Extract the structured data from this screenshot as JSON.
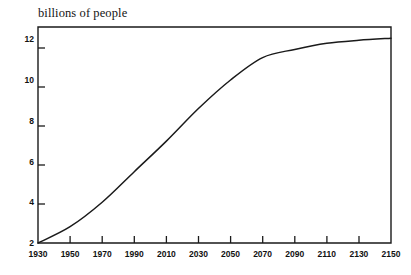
{
  "chart_data": {
    "type": "line",
    "title": "billions of people",
    "subtitle": "",
    "xlabel": "",
    "ylabel": "billions of people",
    "x": [
      1930,
      1950,
      1970,
      1990,
      2010,
      2030,
      2050,
      2070,
      2090,
      2110,
      2130,
      2150
    ],
    "values": [
      2.0,
      2.8,
      4.0,
      5.5,
      7.0,
      8.6,
      10.0,
      11.1,
      11.5,
      11.8,
      11.95,
      12.05
    ],
    "series": [
      {
        "name": "world population",
        "values": [
          2.0,
          2.8,
          4.0,
          5.5,
          7.0,
          8.6,
          10.0,
          11.1,
          11.5,
          11.8,
          11.95,
          12.05
        ]
      }
    ],
    "xlim": [
      1930,
      2150
    ],
    "ylim": [
      2,
      12.6
    ],
    "xticks": [
      1930,
      1950,
      1970,
      1990,
      2010,
      2030,
      2050,
      2070,
      2090,
      2110,
      2130,
      2150
    ],
    "yticks": [
      2,
      4,
      6,
      8,
      10,
      12
    ],
    "xtick_labels": [
      "1930",
      "1950",
      "1970",
      "1990",
      "2010",
      "2030",
      "2050",
      "2070",
      "2090",
      "2110",
      "2130",
      "2150"
    ],
    "ytick_labels": [
      "2",
      "4",
      "6",
      "8",
      "10",
      "12"
    ],
    "grid": false,
    "legend": false,
    "legend_position": "none",
    "line_color": "#1a1a1a",
    "axis_color": "#1a1a1a",
    "background_color": "#ffffff",
    "annotations": []
  }
}
